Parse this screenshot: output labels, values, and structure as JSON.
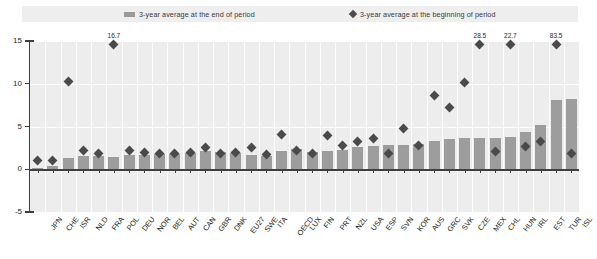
{
  "legend": {
    "end_of_period": "3-year average at the end of period",
    "beginning_of_period": "3-year average at the beginning of period",
    "bar_color": "#9d9d9d",
    "diamond_color": "#4a4a4a"
  },
  "chart_data": {
    "type": "bar",
    "title": "",
    "subtitle": "",
    "xlabel": "",
    "ylabel": "",
    "ylim": [
      -5,
      15
    ],
    "yticks": [
      15,
      10,
      5,
      0,
      -5
    ],
    "grid": true,
    "legend_position": "top",
    "categories": [
      "JPN",
      "CHE",
      "ISR",
      "NLD",
      "FRA",
      "POL",
      "DEU",
      "NOR",
      "BEL",
      "AUT",
      "CAN",
      "GBR",
      "DNK",
      "EU27",
      "SWE",
      "ITA",
      "OECD",
      "LUX",
      "FIN",
      "PRT",
      "NZL",
      "USA",
      "ESP",
      "SVN",
      "KOR",
      "AUS",
      "GRC",
      "SVK",
      "CZE",
      "MEX",
      "CHL",
      "HUN",
      "IRL",
      "EST",
      "TUR",
      "ISL"
    ],
    "series": [
      {
        "name": "3-year average at the end of period",
        "type": "bar",
        "values": [
          0.2,
          0.4,
          1.3,
          1.6,
          1.5,
          1.4,
          1.7,
          1.7,
          1.8,
          1.8,
          1.9,
          2.1,
          2.0,
          1.9,
          1.7,
          1.6,
          2.1,
          2.4,
          2.0,
          2.1,
          2.3,
          2.6,
          2.7,
          2.8,
          2.8,
          3.0,
          3.3,
          3.5,
          3.6,
          3.6,
          3.7,
          3.8,
          4.3,
          5.2,
          8.1,
          8.2
        ]
      },
      {
        "name": "3-year average at the beginning of period",
        "type": "scatter",
        "values": [
          1.0,
          1.0,
          10.3,
          2.2,
          1.9,
          16.7,
          2.2,
          2.0,
          1.9,
          1.9,
          2.0,
          2.6,
          1.8,
          2.0,
          2.5,
          1.7,
          4.1,
          2.2,
          1.8,
          4.0,
          2.8,
          3.2,
          3.6,
          1.9,
          4.8,
          2.8,
          8.6,
          7.2,
          10.1,
          28.5,
          2.1,
          22.7,
          2.7,
          3.2,
          83.5,
          1.9
        ]
      }
    ],
    "annotations": [
      {
        "category": "POL",
        "value": "16.7"
      },
      {
        "category": "MEX",
        "value": "28.5"
      },
      {
        "category": "HUN",
        "value": "22.7"
      },
      {
        "category": "TUR",
        "value": "83.5"
      }
    ]
  }
}
